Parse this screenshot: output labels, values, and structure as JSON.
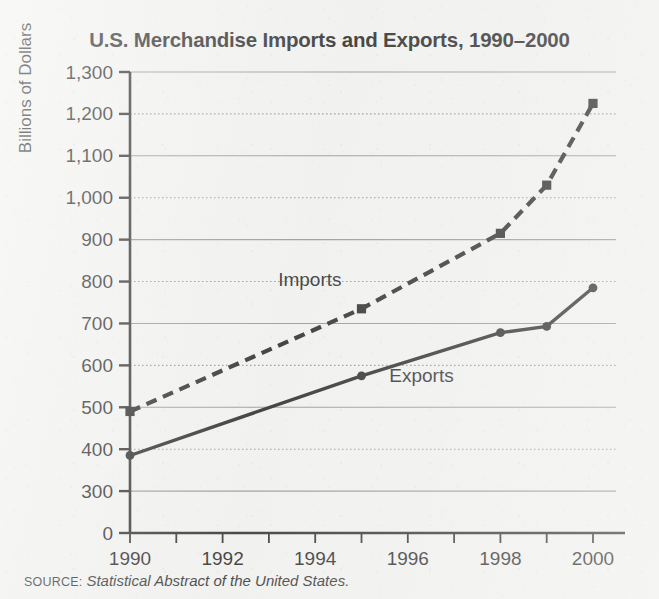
{
  "chart_data": {
    "type": "line",
    "title": "U.S. Merchandise Imports and Exports, 1990–2000",
    "xlabel": "",
    "ylabel": "Billions of Dollars",
    "x": [
      1990,
      1995,
      1998,
      1999,
      2000
    ],
    "xlim": [
      1990,
      2000
    ],
    "ylim": [
      0,
      1300
    ],
    "y_break_after_zero": true,
    "yticks": [
      0,
      300,
      400,
      500,
      600,
      700,
      800,
      900,
      1000,
      1100,
      1200,
      1300
    ],
    "ytick_labels": [
      "0",
      "300",
      "400",
      "500",
      "600",
      "700",
      "800",
      "900",
      "1,000",
      "1,100",
      "1,200",
      "1,300"
    ],
    "xticks": [
      1990,
      1991,
      1992,
      1993,
      1994,
      1995,
      1996,
      1997,
      1998,
      1999,
      2000
    ],
    "xtick_labels_major": [
      "1990",
      "1992",
      "1994",
      "1996",
      "1998",
      "2000"
    ],
    "xticks_major": [
      1990,
      1992,
      1994,
      1996,
      1998,
      2000
    ],
    "grid": true,
    "grid_axis": "y",
    "legend": "inline-annotations",
    "series": [
      {
        "name": "Imports",
        "style": "dashed",
        "marker": "square",
        "color": "#141414",
        "values": [
          490,
          735,
          915,
          1030,
          1225
        ],
        "label_x": 1993.2,
        "label_y": 790
      },
      {
        "name": "Exports",
        "style": "solid",
        "marker": "circle",
        "color": "#141414",
        "values": [
          385,
          575,
          678,
          693,
          785
        ],
        "label_x": 1995.6,
        "label_y": 560
      }
    ],
    "annotations": []
  },
  "source": {
    "label": "SOURCE:",
    "text": "Statistical Abstract of the United States."
  },
  "colors": {
    "background": "#f2f2f0",
    "ink": "#141414",
    "gridline": "#8d8d8d",
    "axis": "#1b1b1b"
  }
}
